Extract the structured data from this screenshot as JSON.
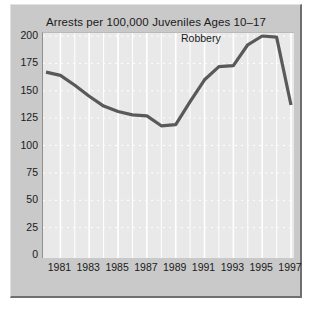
{
  "chart_data": {
    "type": "line",
    "title": "Arrests per 100,000 Juveniles Ages 10–17",
    "xlabel": "",
    "ylabel": "",
    "xlim": [
      1980,
      1997
    ],
    "ylim": [
      0,
      200
    ],
    "yticks": [
      0,
      25,
      50,
      75,
      100,
      125,
      150,
      175,
      200
    ],
    "ytick_labels": [
      "0",
      "25",
      "50",
      "75",
      "100",
      "125",
      "150",
      "175",
      "200"
    ],
    "xticks": [
      1981,
      1983,
      1985,
      1987,
      1989,
      1991,
      1993,
      1995,
      1997
    ],
    "xtick_labels": [
      "1981",
      "1983",
      "1985",
      "1987",
      "1989",
      "1991",
      "1993",
      "1995",
      "1997"
    ],
    "grid": true,
    "grid_color": "#ffffff",
    "plot_bg": "#e9e9e9",
    "figure_bg": "#c9c9c9",
    "line_color": "#595959",
    "legend": "none",
    "annotations": [
      {
        "text": "Robbery",
        "x": 1991.1,
        "y": 196
      }
    ],
    "series": [
      {
        "name": "Robbery",
        "x": [
          1980,
          1981,
          1982,
          1983,
          1984,
          1985,
          1986,
          1987,
          1988,
          1989,
          1990,
          1991,
          1992,
          1993,
          1994,
          1995,
          1996,
          1997
        ],
        "values": [
          167,
          164,
          155,
          145,
          136,
          131,
          128,
          127,
          118,
          119,
          140,
          160,
          172,
          173,
          192,
          200,
          199,
          137
        ]
      }
    ]
  },
  "figure": {
    "title": "Arrests per 100,000 Juveniles Ages 10–17",
    "series_label": "Robbery"
  }
}
